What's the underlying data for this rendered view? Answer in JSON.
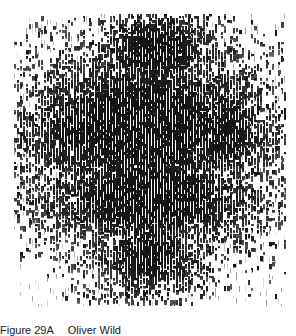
{
  "figure": {
    "colors": {
      "ink": "#1c1c1c",
      "paper": "#ffffff"
    }
  },
  "caption": {
    "label": "Figure 29A",
    "text": "Oliver Wild"
  }
}
